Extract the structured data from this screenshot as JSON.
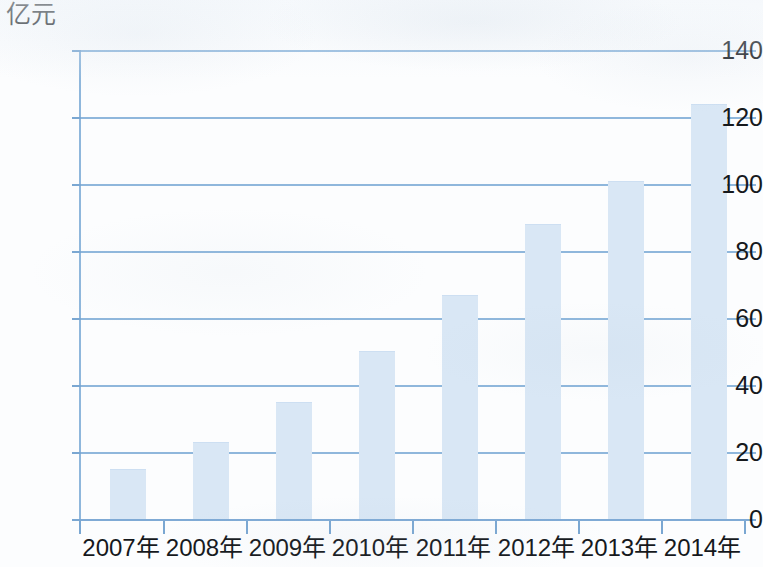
{
  "chart_data": {
    "type": "bar",
    "title": "",
    "subtitle": "",
    "xlabel": "",
    "ylabel": "亿元",
    "unit_label": "亿元",
    "categories": [
      "2007年",
      "2008年",
      "2009年",
      "2010年",
      "2011年",
      "2012年",
      "2013年",
      "2014年"
    ],
    "values": [
      15,
      23,
      35,
      50,
      67,
      88,
      101,
      124
    ],
    "ylim": [
      0,
      140
    ],
    "ytick_labels": [
      "0",
      "20",
      "40",
      "60",
      "80",
      "100",
      "120",
      "140"
    ],
    "ytick_values": [
      0,
      20,
      40,
      60,
      80,
      100,
      120,
      140
    ],
    "grid": true,
    "grid_axis": "y",
    "legend": null,
    "legend_position": "none",
    "annotations": [],
    "colors": {
      "bar_fill": "#d9e7f5",
      "gridline": "#8fb7dc",
      "axis": "#7faad5",
      "text": "#15181c",
      "background": "#fcfdfe"
    }
  }
}
